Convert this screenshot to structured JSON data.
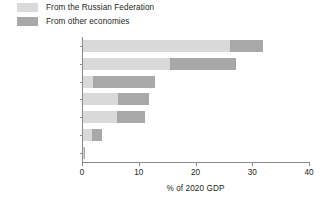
{
  "legend": {
    "position": "top-left",
    "entries": [
      {
        "label": "From the Russian Federation",
        "color": "#d9d9d9",
        "key": "russia"
      },
      {
        "label": "From other economies",
        "color": "#a8a8a8",
        "key": "other"
      }
    ]
  },
  "axis": {
    "x_title": "% of 2020 GDP",
    "x_ticks": [
      "0",
      "10",
      "20",
      "30",
      "40"
    ]
  },
  "chart_data": {
    "type": "bar",
    "orientation": "horizontal",
    "stacked": true,
    "title": "",
    "subtitle": "",
    "xlabel": "% of 2020 GDP",
    "ylabel": "",
    "xlim": [
      0,
      40
    ],
    "xticks": [
      0,
      10,
      20,
      30,
      40
    ],
    "grid": false,
    "legend_position": "top-left",
    "categories": [
      "Kyrgyz Republic",
      "Tajikistan",
      "Georgia",
      "Uzbekistan",
      "Armenia",
      "Azerbaijan",
      "Kazakhstan"
    ],
    "series": [
      {
        "name": "From the Russian Federation",
        "color": "#d9d9d9",
        "values": [
          25.9,
          15.4,
          1.7,
          6.2,
          6.0,
          1.6,
          0.2
        ]
      },
      {
        "name": "From other economies",
        "color": "#a8a8a8",
        "values": [
          5.9,
          11.6,
          11.0,
          5.5,
          4.9,
          1.7,
          0.1
        ]
      }
    ],
    "totals": [
      31.8,
      27.0,
      12.7,
      11.7,
      10.9,
      3.3,
      0.3
    ]
  }
}
